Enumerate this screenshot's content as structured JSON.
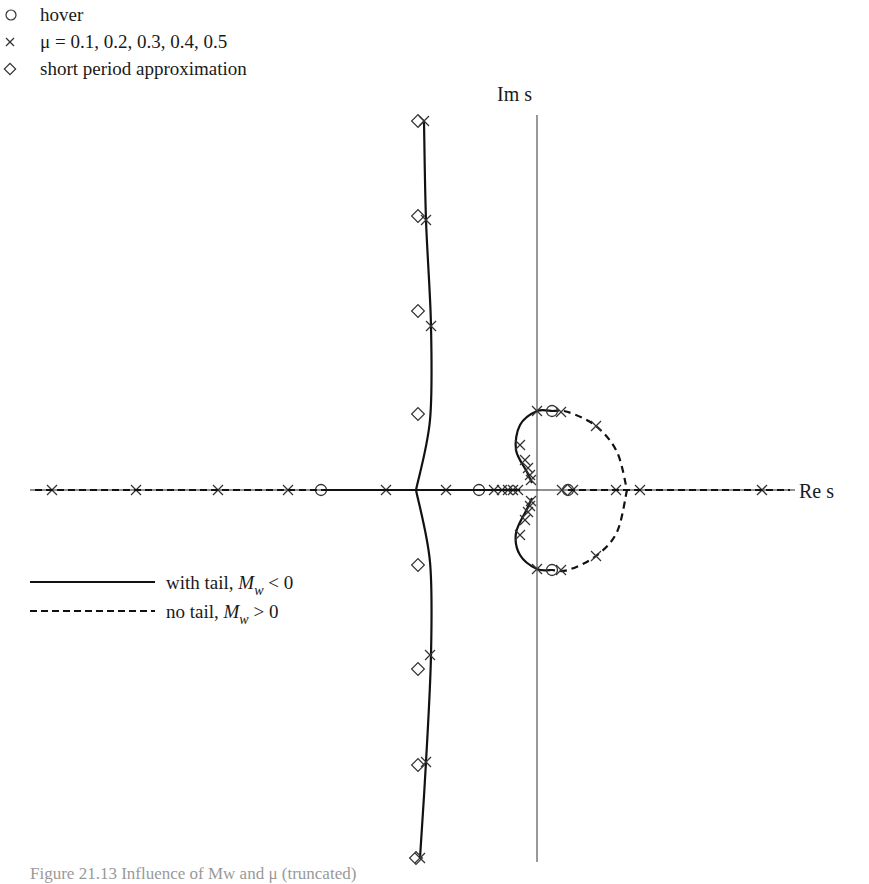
{
  "chart_data": {
    "type": "scatter",
    "title": "",
    "xlabel": "Re s",
    "ylabel": "Im s",
    "grid": false,
    "legend_position": "upper-left (markers), lower-left (lines)",
    "marker_legend": [
      {
        "symbol": "circle",
        "label": "hover"
      },
      {
        "symbol": "x",
        "label": "μ = 0.1, 0.2, 0.3, 0.4, 0.5"
      },
      {
        "symbol": "diamond",
        "label": "short period approximation"
      }
    ],
    "line_legend": [
      {
        "style": "solid",
        "label_prefix": "with tail, ",
        "label_var": "M",
        "label_sub": "w",
        "label_suffix": " < 0"
      },
      {
        "style": "dashed",
        "label_prefix": "no tail, ",
        "label_var": "M",
        "label_sub": "w",
        "label_suffix": " > 0"
      }
    ],
    "axes_px": {
      "origin_x": 537,
      "origin_y": 490
    },
    "series": [
      {
        "name": "with tail, Mw < 0 (short period branch, upper)",
        "style": "solid",
        "points_px": [
          [
            424,
            121
          ],
          [
            426,
            220
          ],
          [
            431,
            326
          ],
          [
            430,
            420
          ],
          [
            416,
            490
          ]
        ]
      },
      {
        "name": "with tail, Mw < 0 (short period branch, lower)",
        "style": "solid",
        "points_px": [
          [
            416,
            490
          ],
          [
            430,
            562
          ],
          [
            431,
            655
          ],
          [
            426,
            762
          ],
          [
            420,
            858
          ]
        ]
      },
      {
        "name": "with tail, Mw < 0 (phugoid upper)",
        "style": "solid",
        "points_px": [
          [
            552,
            411
          ],
          [
            537,
            411
          ],
          [
            520,
            425
          ],
          [
            516,
            450
          ],
          [
            527,
            472
          ],
          [
            532,
            483
          ]
        ]
      },
      {
        "name": "with tail, Mw < 0 (phugoid lower)",
        "style": "solid",
        "points_px": [
          [
            532,
            498
          ],
          [
            527,
            509
          ],
          [
            516,
            533
          ],
          [
            520,
            555
          ],
          [
            537,
            569
          ],
          [
            552,
            570
          ]
        ]
      },
      {
        "name": "no tail, Mw > 0 (phugoid upper)",
        "style": "dashed",
        "points_px": [
          [
            552,
            411
          ],
          [
            568,
            412
          ],
          [
            596,
            426
          ],
          [
            617,
            452
          ],
          [
            627,
            490
          ]
        ]
      },
      {
        "name": "no tail, Mw > 0 (phugoid lower)",
        "style": "dashed",
        "points_px": [
          [
            627,
            490
          ],
          [
            617,
            532
          ],
          [
            596,
            556
          ],
          [
            568,
            570
          ],
          [
            552,
            570
          ]
        ]
      }
    ],
    "markers": {
      "hover_px": [
        [
          321,
          490
        ],
        [
          479,
          490
        ],
        [
          552,
          411
        ],
        [
          552,
          570
        ],
        [
          568,
          490
        ]
      ],
      "mu_px": [
        [
          52,
          490
        ],
        [
          136,
          490
        ],
        [
          218,
          490
        ],
        [
          288,
          490
        ],
        [
          386,
          490
        ],
        [
          446,
          490
        ],
        [
          494,
          490
        ],
        [
          502,
          490
        ],
        [
          508,
          490
        ],
        [
          513,
          490
        ],
        [
          518,
          490
        ],
        [
          424,
          121
        ],
        [
          426,
          220
        ],
        [
          431,
          326
        ],
        [
          430,
          655
        ],
        [
          426,
          762
        ],
        [
          420,
          858
        ],
        [
          537,
          411
        ],
        [
          561,
          412
        ],
        [
          596,
          426
        ],
        [
          520,
          445
        ],
        [
          525,
          460
        ],
        [
          528,
          468
        ],
        [
          530,
          475
        ],
        [
          531,
          480
        ],
        [
          537,
          569
        ],
        [
          561,
          570
        ],
        [
          596,
          556
        ],
        [
          520,
          535
        ],
        [
          525,
          520
        ],
        [
          528,
          512
        ],
        [
          530,
          506
        ],
        [
          531,
          501
        ],
        [
          562,
          490
        ],
        [
          573,
          490
        ],
        [
          616,
          490
        ],
        [
          640,
          490
        ],
        [
          762,
          490
        ]
      ],
      "diamond_px": [
        [
          418,
          121
        ],
        [
          418,
          216
        ],
        [
          418,
          311
        ],
        [
          418,
          414
        ],
        [
          418,
          565
        ],
        [
          418,
          669
        ],
        [
          418,
          765
        ],
        [
          416,
          858
        ]
      ]
    }
  },
  "labels": {
    "axis_re": "Re s",
    "axis_im": "Im s",
    "legend_hover": "hover",
    "legend_mu": "μ = 0.1, 0.2, 0.3, 0.4, 0.5",
    "legend_short": "short period approximation",
    "legend_tail_prefix": "with tail, ",
    "legend_notail_prefix": "no tail, ",
    "legend_var": "M",
    "legend_sub": "w",
    "legend_tail_suffix": " < 0",
    "legend_notail_suffix": " > 0",
    "caption": "Figure 21.13 Influence of Mw and μ (truncated)"
  }
}
